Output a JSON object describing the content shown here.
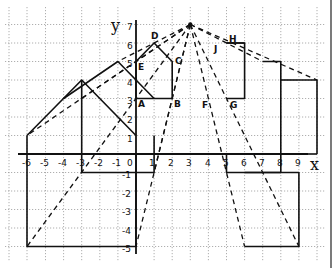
{
  "diagram": {
    "type": "coordinate-grid-enlargement",
    "axes": {
      "x_label": "x",
      "y_label": "y",
      "x_ticks": [
        "-6",
        "-5",
        "-4",
        "-3",
        "-2",
        "-1",
        "0",
        "1",
        "2",
        "3",
        "4",
        "5",
        "6",
        "7",
        "8",
        "9"
      ],
      "y_ticks_positive": [
        "1",
        "2",
        "3",
        "4",
        "5",
        "6",
        "7"
      ],
      "y_ticks_negative": [
        "-1",
        "-2",
        "-3",
        "-4",
        "-5"
      ]
    },
    "center_of_enlargement": [
      3,
      7
    ],
    "point_labels": [
      {
        "name": "A",
        "text": "A"
      },
      {
        "name": "B",
        "text": "B"
      },
      {
        "name": "C",
        "text": "C"
      },
      {
        "name": "D",
        "text": "D"
      },
      {
        "name": "E",
        "text": "E"
      },
      {
        "name": "F",
        "text": "F"
      },
      {
        "name": "G",
        "text": "G"
      },
      {
        "name": "H",
        "text": "H"
      },
      {
        "name": "J",
        "text": "J"
      }
    ],
    "colors": {
      "ink": "#111111",
      "grid": "#9a9a9a",
      "paper": "#ffffff"
    }
  }
}
